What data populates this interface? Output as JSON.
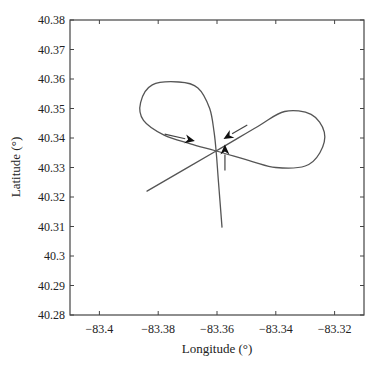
{
  "chart_data": {
    "type": "line",
    "title": "",
    "xlabel": "Longitude (°)",
    "ylabel": "Latitude (°)",
    "xlim": [
      -83.41,
      -83.31
    ],
    "ylim": [
      40.28,
      40.38
    ],
    "grid": false,
    "legend": null,
    "xticks": [
      "−83.4",
      "−83.38",
      "−83.36",
      "−83.34",
      "−83.32"
    ],
    "xtick_values": [
      -83.4,
      -83.38,
      -83.36,
      -83.34,
      -83.32
    ],
    "yticks": [
      "40.28",
      "40.29",
      "40.3",
      "40.31",
      "40.32",
      "40.33",
      "40.34",
      "40.35",
      "40.36",
      "40.37",
      "40.38"
    ],
    "ytick_values": [
      40.28,
      40.29,
      40.3,
      40.31,
      40.32,
      40.33,
      40.34,
      40.35,
      40.36,
      40.37,
      40.38
    ],
    "series": [
      {
        "name": "trajectory",
        "description": "Figure-eight ground track crossing at approx (-83.360, 40.3356), with entry leg from the south and exit leg to the south-west",
        "points_lonlat": [
          [
            -83.3583,
            40.3098
          ],
          [
            -83.3595,
            40.325
          ],
          [
            -83.3603,
            40.3356
          ],
          [
            -83.361,
            40.342
          ],
          [
            -83.3625,
            40.35
          ],
          [
            -83.3665,
            40.357
          ],
          [
            -83.373,
            40.359
          ],
          [
            -83.382,
            40.358
          ],
          [
            -83.386,
            40.352
          ],
          [
            -83.385,
            40.346
          ],
          [
            -83.378,
            40.341
          ],
          [
            -83.369,
            40.338
          ],
          [
            -83.3603,
            40.3356
          ],
          [
            -83.348,
            40.332
          ],
          [
            -83.34,
            40.33
          ],
          [
            -83.33,
            40.3305
          ],
          [
            -83.325,
            40.335
          ],
          [
            -83.3235,
            40.342
          ],
          [
            -83.328,
            40.348
          ],
          [
            -83.337,
            40.349
          ],
          [
            -83.346,
            40.344
          ],
          [
            -83.3603,
            40.3356
          ],
          [
            -83.3838,
            40.322
          ]
        ]
      }
    ],
    "annotations": [
      {
        "type": "arrow",
        "direction": "up",
        "from": [
          -83.3573,
          40.329
        ],
        "to": [
          -83.3573,
          40.3378
        ]
      },
      {
        "type": "arrow",
        "direction": "right",
        "from": [
          -83.3778,
          40.3413
        ],
        "to": [
          -83.3675,
          40.339
        ]
      },
      {
        "type": "arrow",
        "direction": "down-left",
        "from": [
          -83.3497,
          40.3444
        ],
        "to": [
          -83.3578,
          40.3397
        ]
      }
    ]
  },
  "labels": {
    "xlabel": "Longitude (°)",
    "ylabel": "Latitude (°)"
  }
}
